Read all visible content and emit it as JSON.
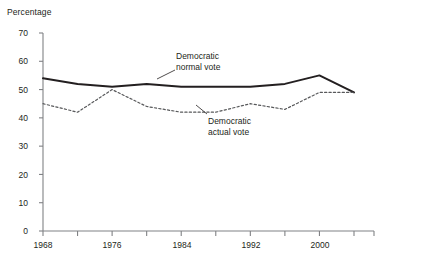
{
  "chart_data": {
    "type": "line",
    "title": "",
    "ylabel": "Percentage",
    "xlabel": "",
    "ylim": [
      0,
      70
    ],
    "xlim": [
      1968,
      2004
    ],
    "grid": false,
    "legend_position": "inline-annotations",
    "ytick_labels": [
      "0",
      "10",
      "20",
      "30",
      "40",
      "50",
      "60",
      "70"
    ],
    "ytick_values": [
      0,
      10,
      20,
      30,
      40,
      50,
      60,
      70
    ],
    "xtick_labels": [
      "1968",
      "1976",
      "1984",
      "1992",
      "2000"
    ],
    "xtick_values": [
      1968,
      1976,
      1984,
      1992,
      2000
    ],
    "x": [
      1968,
      1972,
      1976,
      1980,
      1984,
      1988,
      1992,
      1996,
      2000,
      2004
    ],
    "series": [
      {
        "name": "Democratic normal vote",
        "style": "solid",
        "color": "#231f20",
        "values": [
          54,
          52,
          51,
          52,
          51,
          51,
          51,
          52,
          55,
          49
        ]
      },
      {
        "name": "Democratic actual vote",
        "style": "dashed",
        "color": "#58595b",
        "values": [
          45,
          42,
          50,
          44,
          42,
          42,
          45,
          43,
          49,
          49
        ]
      }
    ],
    "annotations": [
      {
        "id": "normal-vote-label",
        "line1": "Democratic",
        "line2": "normal vote"
      },
      {
        "id": "actual-vote-label",
        "line1": "Democratic",
        "line2": "actual vote"
      }
    ]
  },
  "axis": {
    "color": "#808285",
    "tick_color": "#808285"
  }
}
